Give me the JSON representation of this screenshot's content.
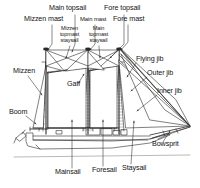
{
  "diagram": {
    "style": {
      "line_color": "#2a2a2a",
      "sail_fill": "#ffffff",
      "background": "#ffffff",
      "text_color": "#141414",
      "waterline_color": "#8a8a8a"
    }
  },
  "labels": {
    "main_topsail": "Main topsail",
    "fore_topsail": "Fore topsail",
    "mizzen_mast": "Mizzen mast",
    "main_mast": "Main mast",
    "fore_mast": "Fore mast",
    "mizzen_topmast_staysail": "Mizzen topmast staysail",
    "main_topmast_staysail": "Main topmast staysail",
    "mizzen": "Mizzen",
    "gaff": "Gaff",
    "boom": "Boom",
    "flying_jib": "Flying jib",
    "outer_jib": "Outer jib",
    "inner_jib": "Inner jib",
    "bowsprit": "Bowsprit",
    "mainsail": "Mainsail",
    "foresail": "Foresail",
    "staysail": "Staysail"
  },
  "label_positions": {
    "main_topsail": {
      "x": 57,
      "y": 7,
      "size": "m"
    },
    "fore_topsail": {
      "x": 106,
      "y": 7,
      "size": "m"
    },
    "mizzen_mast": {
      "x": 36,
      "y": 18,
      "size": "m"
    },
    "main_mast": {
      "x": 84,
      "y": 18,
      "size": "m"
    },
    "fore_mast": {
      "x": 118,
      "y": 18,
      "size": "m"
    },
    "mizzen_topmast_staysail": {
      "x": 60,
      "y": 28,
      "size": "s"
    },
    "main_topmast_staysail": {
      "x": 89,
      "y": 28,
      "size": "s"
    },
    "mizzen": {
      "x": 14,
      "y": 71,
      "size": "m"
    },
    "gaff": {
      "x": 68,
      "y": 85,
      "size": "m"
    },
    "boom": {
      "x": 10,
      "y": 112,
      "size": "m"
    },
    "flying_jib": {
      "x": 137,
      "y": 59,
      "size": "m"
    },
    "outer_jib": {
      "x": 148,
      "y": 72,
      "size": "m"
    },
    "inner_jib": {
      "x": 158,
      "y": 90,
      "size": "m"
    },
    "bowsprit": {
      "x": 153,
      "y": 144,
      "size": "m"
    },
    "mainsail": {
      "x": 56,
      "y": 172,
      "size": "m"
    },
    "foresail": {
      "x": 94,
      "y": 170,
      "size": "m"
    },
    "staysail": {
      "x": 124,
      "y": 168,
      "size": "m"
    }
  },
  "parts": [
    {
      "name": "main-topsail",
      "kind": "sail",
      "label": "Main topsail"
    },
    {
      "name": "fore-topsail",
      "kind": "sail",
      "label": "Fore topsail"
    },
    {
      "name": "mizzen-mast",
      "kind": "spar",
      "label": "Mizzen mast"
    },
    {
      "name": "main-mast",
      "kind": "spar",
      "label": "Main mast"
    },
    {
      "name": "fore-mast",
      "kind": "spar",
      "label": "Fore mast"
    },
    {
      "name": "mizzen-topmast-staysail",
      "kind": "sail",
      "label": "Mizzen topmast staysail"
    },
    {
      "name": "main-topmast-staysail",
      "kind": "sail",
      "label": "Main topmast staysail"
    },
    {
      "name": "mizzen",
      "kind": "sail",
      "label": "Mizzen"
    },
    {
      "name": "gaff",
      "kind": "spar",
      "label": "Gaff"
    },
    {
      "name": "boom",
      "kind": "spar",
      "label": "Boom"
    },
    {
      "name": "flying-jib",
      "kind": "sail",
      "label": "Flying jib"
    },
    {
      "name": "outer-jib",
      "kind": "sail",
      "label": "Outer jib"
    },
    {
      "name": "inner-jib",
      "kind": "sail",
      "label": "Inner jib"
    },
    {
      "name": "bowsprit",
      "kind": "spar",
      "label": "Bowsprit"
    },
    {
      "name": "mainsail",
      "kind": "sail",
      "label": "Mainsail"
    },
    {
      "name": "foresail",
      "kind": "sail",
      "label": "Foresail"
    },
    {
      "name": "staysail",
      "kind": "sail",
      "label": "Staysail"
    }
  ]
}
